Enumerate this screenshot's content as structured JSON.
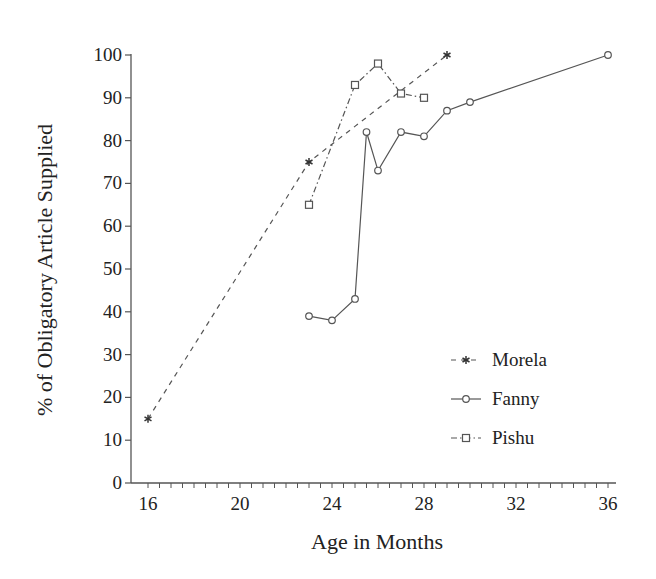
{
  "chart_data": {
    "type": "line",
    "title": "",
    "xlabel": "Age in Months",
    "ylabel": "% of Obligatory Article Supplied",
    "xlim": [
      16,
      36
    ],
    "ylim": [
      0,
      100
    ],
    "x_ticks": [
      16,
      20,
      24,
      28,
      32,
      36
    ],
    "x_minor_tick_step": 0.5,
    "y_ticks": [
      0,
      10,
      20,
      30,
      40,
      50,
      60,
      70,
      80,
      90,
      100
    ],
    "grid": false,
    "legend_position": "lower right (inside)",
    "series": [
      {
        "name": "Morela",
        "line_style": "dashed",
        "marker": "asterisk",
        "x": [
          16,
          23,
          29
        ],
        "values": [
          15,
          75,
          100
        ]
      },
      {
        "name": "Fanny",
        "line_style": "solid",
        "marker": "circle",
        "x": [
          23,
          24,
          25,
          25.5,
          26,
          27,
          28,
          29,
          30,
          36
        ],
        "values": [
          39,
          38,
          43,
          82,
          73,
          82,
          81,
          87,
          89,
          100
        ]
      },
      {
        "name": "Pishu",
        "line_style": "dash-dot",
        "marker": "square",
        "x": [
          23,
          25,
          26,
          27,
          28
        ],
        "values": [
          65,
          93,
          98,
          91,
          90
        ]
      }
    ]
  },
  "colors": {
    "line": "#555555",
    "text": "#222222",
    "background": "#ffffff"
  }
}
